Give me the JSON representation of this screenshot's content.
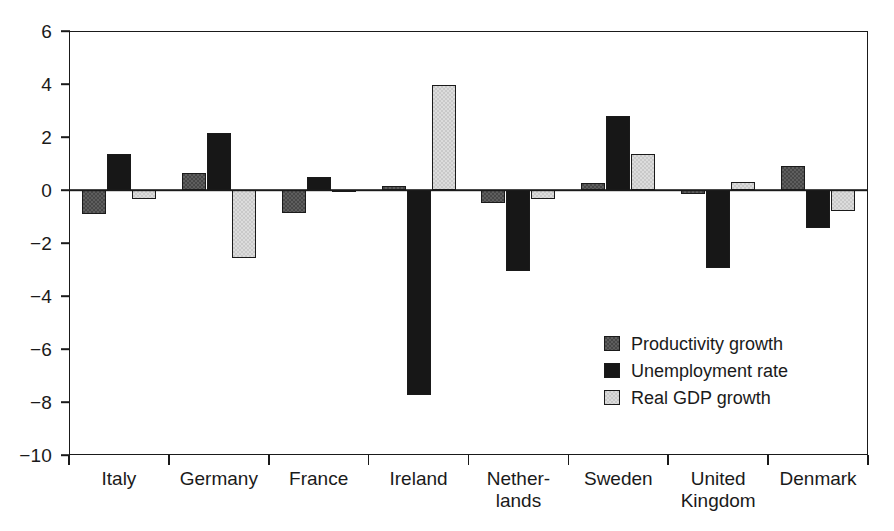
{
  "chart_data": {
    "type": "bar",
    "title": "",
    "subtitle": "",
    "xlabel": "",
    "ylabel": "",
    "ylim": [
      -10,
      6
    ],
    "yticks": [
      6,
      4,
      2,
      0,
      -2,
      -4,
      -6,
      -8,
      -10
    ],
    "ytick_labels": [
      "6",
      "4",
      "2",
      "0",
      "−2",
      "−4",
      "−6",
      "−8",
      "−10"
    ],
    "grid": false,
    "legend_position": "inside-lower-right",
    "zero_line": true,
    "categories": [
      "Italy",
      "Germany",
      "France",
      "Ireland",
      "Nether-\nlands",
      "Sweden",
      "United\nKingdom",
      "Denmark"
    ],
    "category_lines": [
      [
        "Italy"
      ],
      [
        "Germany"
      ],
      [
        "France"
      ],
      [
        "Ireland"
      ],
      [
        "Nether-",
        "lands"
      ],
      [
        "Sweden"
      ],
      [
        "United",
        "Kingdom"
      ],
      [
        "Denmark"
      ]
    ],
    "series": [
      {
        "name": "Productivity growth",
        "color": "#474747",
        "values": [
          -0.9,
          0.65,
          -0.85,
          0.15,
          -0.5,
          0.25,
          -0.15,
          0.9
        ]
      },
      {
        "name": "Unemployment rate",
        "color": "#171717",
        "values": [
          1.35,
          2.15,
          0.5,
          -7.75,
          -3.05,
          2.8,
          -2.95,
          -1.45
        ]
      },
      {
        "name": "Real GDP growth",
        "color": "#c9c9c9",
        "values": [
          -0.35,
          -2.55,
          -0.05,
          3.95,
          -0.35,
          1.35,
          0.3,
          -0.8
        ]
      }
    ]
  },
  "legend": {
    "items": [
      {
        "label": "Productivity growth",
        "swatch": "dark-gray-textured-swatch"
      },
      {
        "label": "Unemployment rate",
        "swatch": "black-swatch"
      },
      {
        "label": "Real GDP growth",
        "swatch": "light-gray-textured-swatch"
      }
    ]
  },
  "colors": {
    "axis": "#1a1a1a",
    "background": "#ffffff",
    "series_productivity": "#474747",
    "series_unemployment": "#171717",
    "series_gdp": "#c9c9c9"
  }
}
